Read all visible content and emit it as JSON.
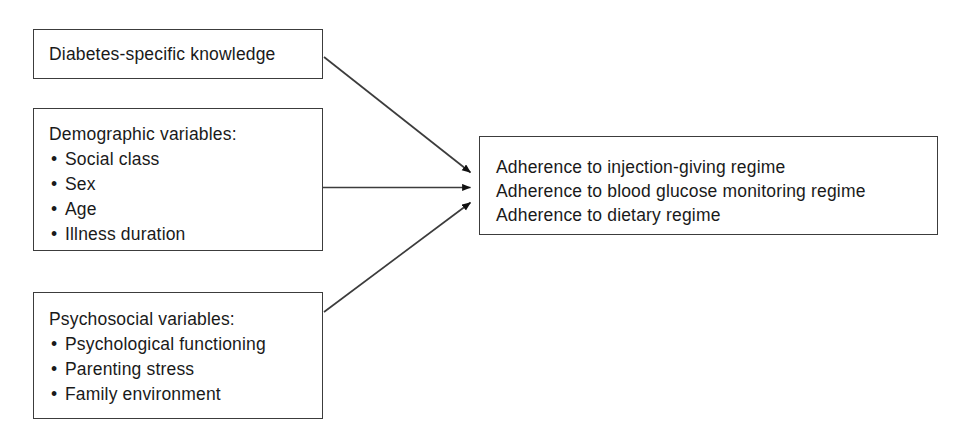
{
  "diagram": {
    "type": "flow-diagram",
    "background_color": "#ffffff",
    "line_color": "#3c3c3c",
    "text_color": "#1a1a1a",
    "nodes": [
      {
        "id": "knowledge",
        "title": "Diabetes-specific knowledge",
        "items": []
      },
      {
        "id": "demographic",
        "title": "Demographic variables:",
        "items": [
          "Social class",
          "Sex",
          "Age",
          "Illness duration"
        ]
      },
      {
        "id": "psychosocial",
        "title": "Psychosocial variables:",
        "items": [
          "Psychological functioning",
          "Parenting stress",
          "Family environment"
        ]
      },
      {
        "id": "adherence",
        "lines": [
          "Adherence to injection-giving regime",
          "Adherence to blood glucose monitoring regime",
          "Adherence to dietary regime"
        ]
      }
    ],
    "edges": [
      {
        "id": "edge-knowledge-adherence",
        "from": "knowledge",
        "to": "adherence",
        "style": "solid-arrow"
      },
      {
        "id": "edge-demographic-adherence",
        "from": "demographic",
        "to": "adherence",
        "style": "solid-arrow"
      },
      {
        "id": "edge-psychosocial-adherence",
        "from": "psychosocial",
        "to": "adherence",
        "style": "solid-arrow"
      }
    ],
    "bullet_glyph": "•"
  }
}
